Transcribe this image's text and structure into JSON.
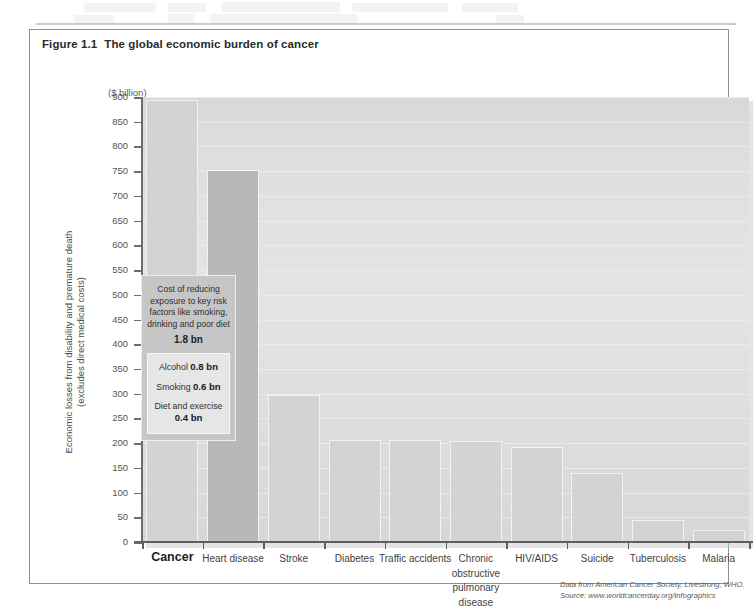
{
  "figure": {
    "number": "Figure 1.1",
    "caption": "The global economic burden of cancer"
  },
  "axis_unit_label": "($ billion)",
  "y_axis_title_line1": "Economic losses from disability and premature death",
  "y_axis_title_line2": "(excludes direct medical costs)",
  "callout": {
    "main_text": "Cost of reducing exposure to key risk factors like smoking, drinking and poor diet",
    "main_value": "1.8 bn",
    "rows": [
      {
        "label": "Alcohol ",
        "value": "0.8 bn"
      },
      {
        "label": "Smoking ",
        "value": "0.6 bn"
      },
      {
        "label": "Diet and exercise ",
        "value": "0.4 bn"
      }
    ]
  },
  "source_note": "Data from American Cancer Society, Livestrong, WHO. Source: www.worldcancerday.org/Infographics",
  "colors": {
    "bar_primary": "#d3d3d3",
    "bar_secondary": "#b8b8b8",
    "plot_background": "#e0e0e0",
    "axis": "#5e5e5e",
    "frame": "#8f8f8f"
  },
  "chart_data": {
    "type": "bar",
    "title": "The global economic burden of cancer",
    "xlabel": "",
    "ylabel": "Economic losses from disability and premature death (excludes direct medical costs)",
    "unit": "$ billion",
    "ylim": [
      0,
      900
    ],
    "ytick_step": 50,
    "yticks": [
      0,
      50,
      100,
      150,
      200,
      250,
      300,
      350,
      400,
      450,
      500,
      550,
      600,
      650,
      700,
      750,
      800,
      850,
      900
    ],
    "grid": true,
    "legend": "none",
    "categories": [
      "Cancer",
      "Heart disease",
      "Stroke",
      "Diabetes",
      "Traffic accidents",
      "Chronic obstructive pulmonary disease",
      "HIV/AIDS",
      "Suicide",
      "Tuberculosis",
      "Malaria"
    ],
    "values": [
      895,
      753,
      298,
      207,
      207,
      204,
      193,
      139,
      44,
      25
    ],
    "annotations": [
      "Cost of reducing exposure to key risk factors like smoking, drinking and poor diet 1.8 bn",
      "Alcohol 0.8 bn",
      "Smoking 0.6 bn",
      "Diet and exercise 0.4 bn"
    ]
  }
}
